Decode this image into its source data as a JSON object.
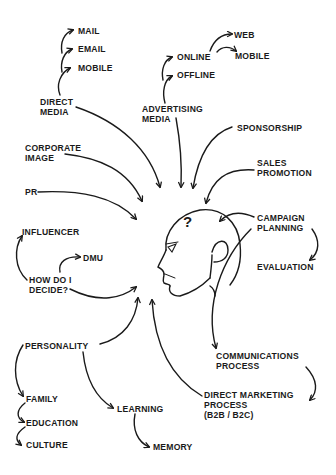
{
  "diagram": {
    "type": "mind-map",
    "center": {
      "label": "?",
      "description": "head-profile"
    },
    "stroke_color": "#1a1a1a",
    "background": "#ffffff",
    "nodes": {
      "mail": {
        "lines": [
          "MAIL"
        ]
      },
      "email": {
        "lines": [
          "EMAIL"
        ]
      },
      "mobile_direct": {
        "lines": [
          "MOBILE"
        ]
      },
      "direct_media": {
        "lines": [
          "DIRECT",
          "MEDIA"
        ]
      },
      "web": {
        "lines": [
          "WEB"
        ]
      },
      "online": {
        "lines": [
          "ONLINE"
        ]
      },
      "mobile_online": {
        "lines": [
          "MOBILE"
        ]
      },
      "offline": {
        "lines": [
          "OFFLINE"
        ]
      },
      "advertising_media": {
        "lines": [
          "ADVERTISING",
          "MEDIA"
        ]
      },
      "sponsorship": {
        "lines": [
          "SPONSORSHIP"
        ]
      },
      "corporate_image": {
        "lines": [
          "CORPORATE",
          "IMAGE"
        ]
      },
      "sales_promotion": {
        "lines": [
          "SALES",
          "PROMOTION"
        ]
      },
      "pr": {
        "lines": [
          "PR"
        ]
      },
      "campaign_planning": {
        "lines": [
          "CAMPAIGN",
          "PLANNING"
        ]
      },
      "influencer": {
        "lines": [
          "INFLUENCER"
        ]
      },
      "dmu": {
        "lines": [
          "DMU"
        ]
      },
      "evaluation": {
        "lines": [
          "EVALUATION"
        ]
      },
      "how_do_i_decide": {
        "lines": [
          "HOW DO I",
          "DECIDE?"
        ]
      },
      "personality": {
        "lines": [
          "PERSONALITY"
        ]
      },
      "communications_process": {
        "lines": [
          "COMMUNICATIONS",
          "PROCESS"
        ]
      },
      "direct_marketing_process": {
        "lines": [
          "DIRECT MARKETING",
          "PROCESS",
          "(B2B / B2C)"
        ]
      },
      "family": {
        "lines": [
          "FAMILY"
        ]
      },
      "education": {
        "lines": [
          "EDUCATION"
        ]
      },
      "learning": {
        "lines": [
          "LEARNING"
        ]
      },
      "culture": {
        "lines": [
          "CULTURE"
        ]
      },
      "memory": {
        "lines": [
          "MEMORY"
        ]
      }
    },
    "edges": [
      {
        "from": "direct_media",
        "to": "mobile_direct"
      },
      {
        "from": "direct_media",
        "to": "email"
      },
      {
        "from": "direct_media",
        "to": "mail"
      },
      {
        "from": "advertising_media",
        "to": "offline"
      },
      {
        "from": "advertising_media",
        "to": "online"
      },
      {
        "from": "online",
        "to": "web"
      },
      {
        "from": "online",
        "to": "mobile_online"
      },
      {
        "from": "direct_media",
        "to": "center"
      },
      {
        "from": "advertising_media",
        "to": "center"
      },
      {
        "from": "sponsorship",
        "to": "center"
      },
      {
        "from": "corporate_image",
        "to": "center"
      },
      {
        "from": "sales_promotion",
        "to": "center"
      },
      {
        "from": "pr",
        "to": "center"
      },
      {
        "from": "campaign_planning",
        "to": "center"
      },
      {
        "from": "campaign_planning",
        "to": "evaluation"
      },
      {
        "from": "campaign_planning",
        "to": "communications_process"
      },
      {
        "from": "communications_process",
        "to": "direct_marketing_process"
      },
      {
        "from": "direct_marketing_process",
        "to": "center"
      },
      {
        "from": "how_do_i_decide",
        "to": "influencer"
      },
      {
        "from": "how_do_i_decide",
        "to": "dmu"
      },
      {
        "from": "how_do_i_decide",
        "to": "center"
      },
      {
        "from": "personality",
        "to": "center"
      },
      {
        "from": "personality",
        "to": "family"
      },
      {
        "from": "family",
        "to": "education"
      },
      {
        "from": "education",
        "to": "culture"
      },
      {
        "from": "personality",
        "to": "learning"
      },
      {
        "from": "learning",
        "to": "memory"
      }
    ]
  }
}
